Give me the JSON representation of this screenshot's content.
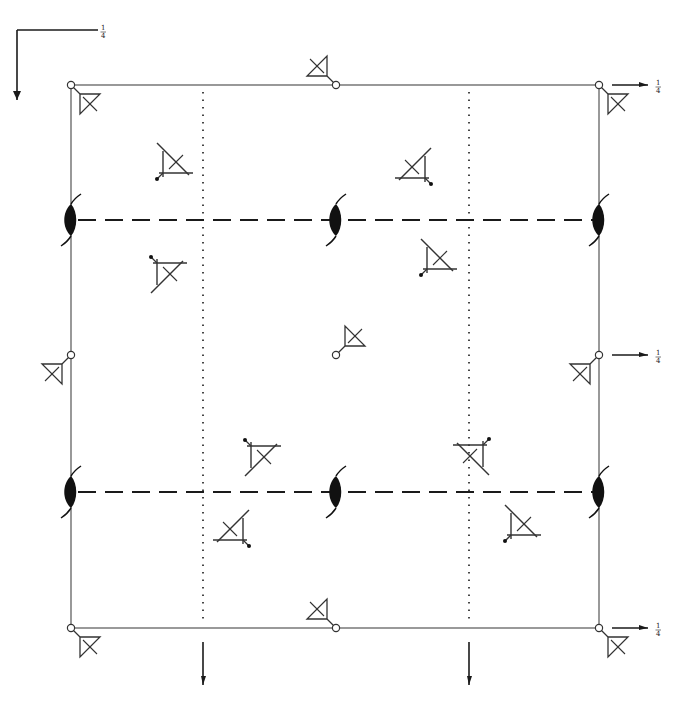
{
  "diagram": {
    "title": "",
    "kind": "space-group symmetry-element and general-position diagram",
    "colors": {
      "lines": "#4a4a4a",
      "ink": "#1a1a1a",
      "background": "#ffffff"
    },
    "cell": {
      "x0": 71,
      "y0": 85,
      "x1": 599,
      "y1": 628
    },
    "axis_indicator": {
      "corner": [
        17,
        30
      ],
      "horizontal_end": [
        98,
        30
      ],
      "vertical_end": [
        17,
        100
      ],
      "label": "1/4"
    },
    "height_labels": [
      {
        "text": "1/4",
        "x": 656,
        "y": 85
      },
      {
        "text": "1/4",
        "x": 656,
        "y": 355
      },
      {
        "text": "1/4",
        "x": 656,
        "y": 628
      }
    ],
    "side_arrows": [
      {
        "x1": 612,
        "y1": 85,
        "x2": 648,
        "y2": 85
      },
      {
        "x1": 612,
        "y1": 355,
        "x2": 648,
        "y2": 355
      },
      {
        "x1": 612,
        "y1": 628,
        "x2": 648,
        "y2": 628
      }
    ],
    "bottom_arrows": [
      {
        "x": 203,
        "y1": 642,
        "y2": 685
      },
      {
        "x": 469,
        "y1": 642,
        "y2": 685
      }
    ],
    "glide_planes_dotted": [
      {
        "x": 203
      },
      {
        "x": 469
      }
    ],
    "glide_planes_dashed": [
      {
        "y": 220
      },
      {
        "y": 492
      }
    ],
    "twofold_screw_axes": [
      {
        "x": 71,
        "y": 220
      },
      {
        "x": 336,
        "y": 220
      },
      {
        "x": 599,
        "y": 220
      },
      {
        "x": 71,
        "y": 492
      },
      {
        "x": 336,
        "y": 492
      },
      {
        "x": 599,
        "y": 492
      }
    ],
    "inversion_centers": [
      {
        "x": 71,
        "y": 85
      },
      {
        "x": 336,
        "y": 85
      },
      {
        "x": 599,
        "y": 85
      },
      {
        "x": 71,
        "y": 355
      },
      {
        "x": 336,
        "y": 355
      },
      {
        "x": 599,
        "y": 355
      },
      {
        "x": 71,
        "y": 628
      },
      {
        "x": 336,
        "y": 628
      },
      {
        "x": 599,
        "y": 628
      }
    ],
    "motifs_inversion": [
      {
        "x": 71,
        "y": 85,
        "dir": "se"
      },
      {
        "x": 599,
        "y": 85,
        "dir": "se"
      },
      {
        "x": 71,
        "y": 628,
        "dir": "se"
      },
      {
        "x": 599,
        "y": 628,
        "dir": "se"
      },
      {
        "x": 336,
        "y": 355,
        "dir": "ne"
      },
      {
        "x": 336,
        "y": 85,
        "dir": "nw"
      },
      {
        "x": 336,
        "y": 628,
        "dir": "nw"
      },
      {
        "x": 71,
        "y": 355,
        "dir": "sw"
      },
      {
        "x": 599,
        "y": 355,
        "dir": "sw"
      }
    ],
    "motifs_dotted": [
      {
        "x": 163,
        "y": 173,
        "sx": 1,
        "sy": 1,
        "note": "top-left, dot lower-left"
      },
      {
        "x": 425,
        "y": 178,
        "sx": -1,
        "sy": 1,
        "note": "upper-right, dot upper-right"
      },
      {
        "x": 157,
        "y": 263,
        "sx": 1,
        "sy": -1,
        "note": "left, dot lower-right"
      },
      {
        "x": 427,
        "y": 269,
        "sx": 1,
        "sy": 1,
        "note": "right, dot upper-left"
      },
      {
        "x": 483,
        "y": 445,
        "sx": -1,
        "sy": -1,
        "note": "lower-right, dot lower-right"
      },
      {
        "x": 251,
        "y": 446,
        "sx": 1,
        "sy": -1,
        "note": "lower-center, dot upper-left"
      },
      {
        "x": 511,
        "y": 535,
        "sx": 1,
        "sy": 1,
        "note": "bottom-right, dot lower-left"
      },
      {
        "x": 243,
        "y": 540,
        "sx": -1,
        "sy": 1,
        "note": "bottom-left, dot upper-right"
      }
    ]
  }
}
